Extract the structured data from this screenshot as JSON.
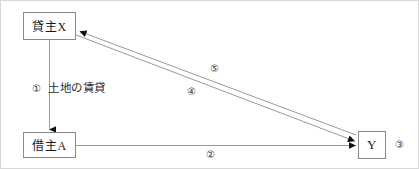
{
  "diagram": {
    "nodes": [
      {
        "id": "lessor",
        "label": "貸主X"
      },
      {
        "id": "lessee",
        "label": "借主A"
      },
      {
        "id": "third_party",
        "label": "Y"
      }
    ],
    "edges": [
      {
        "id": "one",
        "number": "①",
        "text": "土地の賃貸",
        "from": "lessor",
        "to": "lessee"
      },
      {
        "id": "two",
        "number": "②",
        "text": "",
        "from": "lessee",
        "to": "third_party"
      },
      {
        "id": "four",
        "number": "④",
        "text": "",
        "from": "lessor",
        "to": "third_party"
      },
      {
        "id": "five",
        "number": "⑤",
        "text": "",
        "from": "third_party",
        "to": "lessor"
      }
    ],
    "annotations": [
      {
        "id": "three",
        "number": "③",
        "attached_to": "third_party"
      }
    ],
    "colors": {
      "frame_border": "#d8d8d8",
      "box_border": "#8a8a8a",
      "line": "#9a9a9a",
      "arrowhead": "#111111",
      "text": "#1a1a1a"
    }
  }
}
